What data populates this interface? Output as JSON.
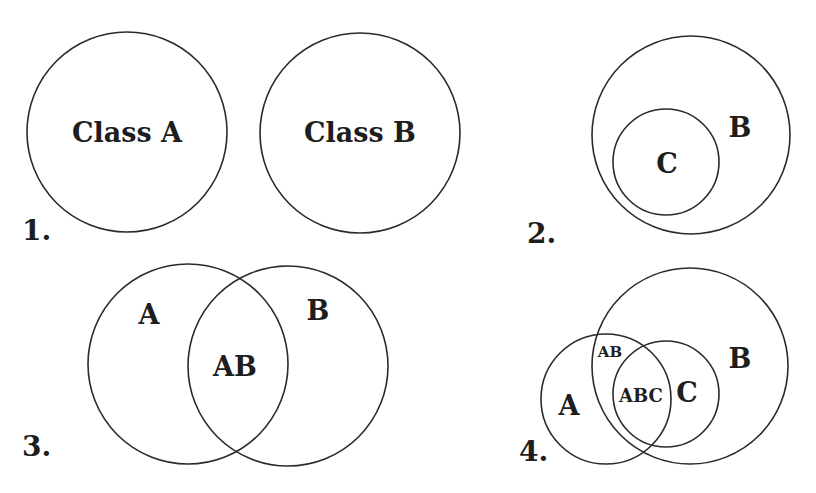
{
  "diagram": {
    "type": "venn-diagram-set",
    "top_cut_text": "",
    "panels": [
      {
        "number": "1.",
        "description": "Two disjoint classes",
        "circles": [
          {
            "id": "A",
            "label": "Class A",
            "cx": 127,
            "cy": 132,
            "r": 100
          },
          {
            "id": "B",
            "label": "Class B",
            "cx": 360,
            "cy": 133,
            "r": 100
          }
        ],
        "regions": []
      },
      {
        "number": "2.",
        "description": "C is a subset of B",
        "circles": [
          {
            "id": "B",
            "label": "B",
            "cx": 691,
            "cy": 135,
            "r": 99
          },
          {
            "id": "C",
            "label": "C",
            "cx": 666,
            "cy": 162,
            "r": 53
          }
        ],
        "regions": []
      },
      {
        "number": "3.",
        "description": "A and B overlap",
        "circles": [
          {
            "id": "A",
            "label": "A",
            "cx": 188,
            "cy": 364,
            "r": 100
          },
          {
            "id": "B",
            "label": "B",
            "cx": 288,
            "cy": 366,
            "r": 100
          }
        ],
        "regions": [
          {
            "label": "AB"
          }
        ]
      },
      {
        "number": "4.",
        "description": "A, B and C overlap",
        "circles": [
          {
            "id": "B",
            "label": "B",
            "cx": 690,
            "cy": 366,
            "r": 98
          },
          {
            "id": "A",
            "label": "A",
            "cx": 606,
            "cy": 399,
            "r": 65
          },
          {
            "id": "C",
            "label": "C",
            "cx": 666,
            "cy": 394,
            "r": 53
          }
        ],
        "regions": [
          {
            "label": "AB"
          },
          {
            "label": "ABC"
          }
        ]
      }
    ]
  }
}
